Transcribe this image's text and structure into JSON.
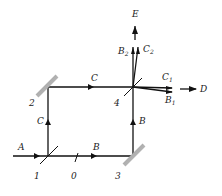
{
  "diagram": {
    "type": "optical interferometer (Mach-Zehnder)",
    "beam_labels": {
      "input": "A",
      "lower_path": "B",
      "right_path": "B",
      "left_path": "C",
      "upper_path": "C",
      "output_up": "E",
      "output_right": "D",
      "b2": "B",
      "b2_sub": "2",
      "c2": "C",
      "c2_sub": "2",
      "c1": "C",
      "c1_sub": "1",
      "b1": "B",
      "b1_sub": "1"
    },
    "component_labels": {
      "splitter_1": "1",
      "mirror_2": "2",
      "mirror_3": "3",
      "splitter_4": "4",
      "phase_element": "0"
    }
  }
}
